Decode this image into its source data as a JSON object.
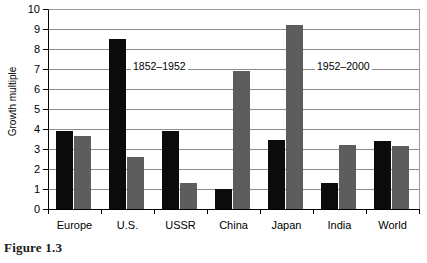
{
  "figure": {
    "caption": "Figure 1.3"
  },
  "chart_data": {
    "type": "bar",
    "title": "",
    "xlabel": "",
    "ylabel": "Growth multiple",
    "ylim": [
      0,
      10
    ],
    "ytick_step": 1,
    "ytick_labels": [
      "0",
      "1",
      "2",
      "3",
      "4",
      "5",
      "6",
      "7",
      "8",
      "9",
      "10"
    ],
    "grid": true,
    "legend_position": "none",
    "categories": [
      "Europe",
      "U.S.",
      "USSR",
      "China",
      "Japan",
      "India",
      "World"
    ],
    "series": [
      {
        "name": "1852–1952",
        "color": "#0b0b0b",
        "values": [
          3.9,
          8.5,
          3.9,
          1.0,
          3.45,
          1.3,
          3.4
        ]
      },
      {
        "name": "1952–2000",
        "color": "#5d5d5d",
        "values": [
          3.65,
          2.6,
          1.3,
          6.9,
          9.2,
          3.2,
          3.15
        ]
      }
    ],
    "annotations": [
      {
        "text": "1852–1952",
        "x_px": 131,
        "y_px": 60
      },
      {
        "text": "1952–2000",
        "x_px": 315,
        "y_px": 60
      }
    ]
  }
}
